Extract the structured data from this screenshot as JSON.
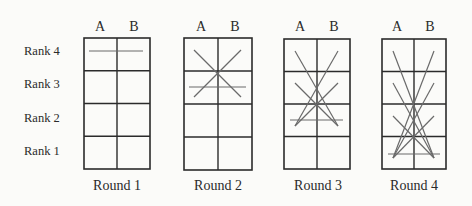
{
  "diagram": {
    "rows": [
      "Rank 4",
      "Rank 3",
      "Rank 2",
      "Rank 1"
    ],
    "columns": [
      "A",
      "B"
    ],
    "colors": {
      "grid": "#2b2b2b",
      "lines": "#6a6a6a",
      "background": "#fbfbf9"
    },
    "panels": [
      {
        "label": "Round 1",
        "box": {
          "x": 84,
          "y": 38,
          "w": 66,
          "h": 131
        },
        "lines": [
          [
            89,
            51,
            143,
            51
          ]
        ]
      },
      {
        "label": "Round 2",
        "box": {
          "x": 184,
          "y": 38,
          "w": 68,
          "h": 132
        },
        "lines": [
          [
            194,
            50,
            241,
            97
          ],
          [
            241,
            50,
            194,
            97
          ],
          [
            189,
            87,
            246,
            87
          ]
        ]
      },
      {
        "label": "Round 3",
        "box": {
          "x": 284,
          "y": 39,
          "w": 66,
          "h": 130
        },
        "lines": [
          [
            295,
            51,
            338,
            126
          ],
          [
            338,
            51,
            295,
            126
          ],
          [
            295,
            83,
            338,
            126
          ],
          [
            338,
            83,
            295,
            126
          ],
          [
            290,
            120,
            343,
            120
          ]
        ]
      },
      {
        "label": "Round 4",
        "box": {
          "x": 382,
          "y": 39,
          "w": 64,
          "h": 130
        },
        "lines": [
          [
            393,
            51,
            434,
            158
          ],
          [
            434,
            51,
            393,
            158
          ],
          [
            393,
            83,
            434,
            158
          ],
          [
            434,
            83,
            393,
            158
          ],
          [
            393,
            116,
            434,
            158
          ],
          [
            434,
            116,
            393,
            158
          ],
          [
            388,
            154,
            440,
            154
          ]
        ]
      }
    ]
  }
}
